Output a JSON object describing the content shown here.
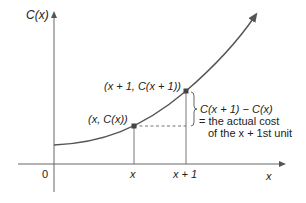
{
  "diagram": {
    "y_axis_label": "C(x)",
    "x_axis_label": "x",
    "origin_label": "0",
    "tick_x": "x",
    "tick_x1": "x + 1",
    "point1_label": "(x, C(x))",
    "point2_label": "(x + 1, C(x + 1))",
    "annotation_line1": "C(x + 1) − C(x)",
    "annotation_line2": "= the actual cost",
    "annotation_line3": "of the x + 1st unit",
    "colors": {
      "curve": "#555555",
      "axes": "#555555",
      "point": "#444444",
      "text": "#222222"
    }
  }
}
